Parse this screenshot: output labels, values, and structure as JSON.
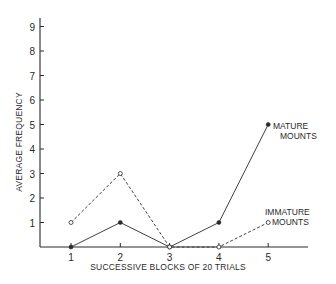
{
  "chart_data": {
    "type": "line",
    "title": "",
    "xlabel": "SUCCESSIVE BLOCKS OF 20 TRIALS",
    "ylabel": "AVERAGE FREQUENCY",
    "x": [
      1,
      2,
      3,
      4,
      5
    ],
    "x_tick_labels": [
      "1",
      "2",
      "3",
      "4",
      "5"
    ],
    "y_tick_labels": [
      "1",
      "2",
      "3",
      "4",
      "5",
      "6",
      "7",
      "8",
      "9"
    ],
    "ylim": [
      0,
      9.5
    ],
    "xlim": [
      0.4,
      5.8
    ],
    "grid": false,
    "legend_position": "inline labels at right",
    "series": [
      {
        "name": "MATURE MOUNTS",
        "label_lines": [
          "MATURE",
          "MOUNTS"
        ],
        "marker": "filled-circle",
        "line_style": "solid",
        "values": [
          0,
          1,
          0,
          1,
          5
        ]
      },
      {
        "name": "IMMATURE MOUNTS",
        "label_lines": [
          "IMMATURE",
          "MOUNTS"
        ],
        "marker": "open-circle",
        "line_style": "dashed",
        "values": [
          1,
          3,
          0,
          0,
          1
        ]
      }
    ]
  },
  "colors": {
    "ink": "#2a2a2a",
    "background": "#ffffff"
  }
}
